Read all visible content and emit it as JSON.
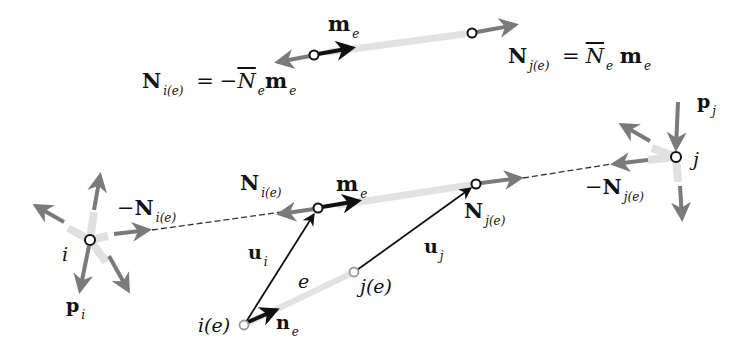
{
  "figure": {
    "type": "truss element force diagram",
    "colors": {
      "gray_arrow": "#7a7a7a",
      "black_arrow": "#111111",
      "element_shade": "#dedede",
      "dashed_line": "#333333",
      "node_fill": "#ffffff",
      "node_stroke": "#111111",
      "ref_node_stroke": "#999999"
    }
  },
  "top_inset": {
    "unit_vector_label": "m",
    "unit_vector_sub": "e",
    "eq_left": {
      "N": "N",
      "N_sub": "i(e)",
      "equals": "=",
      "minus": "−",
      "Nbar": "N",
      "Nbar_sub": "e",
      "m": "m",
      "m_sub": "e"
    },
    "eq_right": {
      "N": "N",
      "N_sub": "j(e)",
      "equals": "=",
      "Nbar": "N",
      "Nbar_sub": "e",
      "m": "m",
      "m_sub": "e"
    }
  },
  "main": {
    "node_i": {
      "label": "i",
      "load_label": "p",
      "load_sub": "i"
    },
    "node_j": {
      "label": "j",
      "load_label": "p",
      "load_sub": "j"
    },
    "neg_N_i": {
      "minus": "−",
      "N": "N",
      "sub": "i(e)"
    },
    "neg_N_j": {
      "minus": "−",
      "N": "N",
      "sub": "j(e)"
    },
    "N_i": {
      "N": "N",
      "sub": "i(e)"
    },
    "N_j": {
      "N": "N",
      "sub": "j(e)"
    },
    "m_e": {
      "m": "m",
      "sub": "e"
    },
    "u_i": {
      "u": "u",
      "sub": "i"
    },
    "u_j": {
      "u": "u",
      "sub": "j"
    },
    "element": {
      "label": "e"
    },
    "ref_i": {
      "label": "i(e)"
    },
    "ref_j": {
      "label": "j(e)"
    },
    "n_e": {
      "n": "n",
      "sub": "e"
    }
  }
}
